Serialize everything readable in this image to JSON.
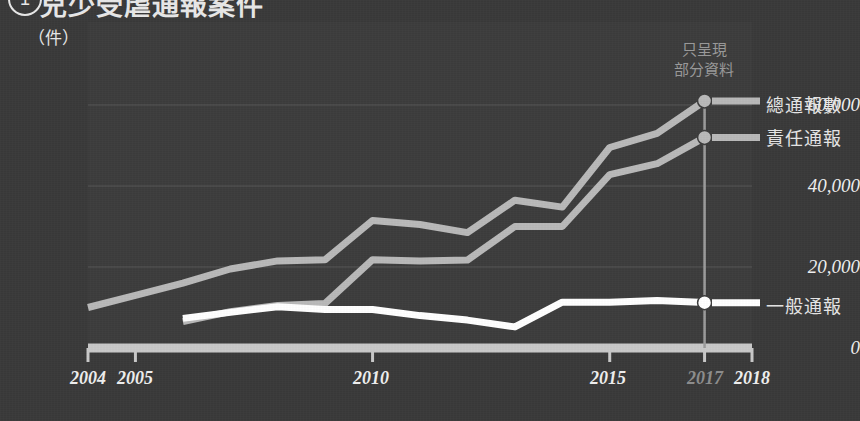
{
  "header": {
    "number": "1",
    "title": "兒少受虐通報案件"
  },
  "annotation": {
    "line1": "只呈現",
    "line2": "部分資料"
  },
  "legend": [
    {
      "label": "總通報數",
      "color": "#b9b9b9",
      "key": "total"
    },
    {
      "label": "責任通報",
      "color": "#b9b9b9",
      "key": "responsible"
    },
    {
      "label": "一般通報",
      "color": "#ffffff",
      "key": "general"
    }
  ],
  "chart_data": {
    "type": "line",
    "title": "兒少受虐通報案件",
    "xlabel": "",
    "ylabel": "件",
    "y_unit_label": "（件）",
    "ylim": [
      0,
      70000
    ],
    "yticks": [
      0,
      20000,
      40000,
      60000
    ],
    "ytick_labels": [
      "0",
      "20,000",
      "40,000",
      "60,000"
    ],
    "grid": true,
    "xlim": [
      2004,
      2018
    ],
    "xticks": [
      2004,
      2005,
      2010,
      2015,
      2017,
      2018
    ],
    "xtick_labels": [
      "2004",
      "2005",
      "2010",
      "2015",
      "2017",
      "2018"
    ],
    "xtick_dimmed": [
      "2017"
    ],
    "legend_position": "right",
    "marker_year": 2017,
    "series": [
      {
        "name": "總通報數",
        "color": "#b9b9b9",
        "x": [
          2004,
          2005,
          2006,
          2007,
          2008,
          2009,
          2010,
          2011,
          2012,
          2013,
          2014,
          2015,
          2016,
          2017
        ],
        "values": [
          10000,
          13000,
          16000,
          19500,
          21500,
          21800,
          31500,
          30500,
          28500,
          36500,
          34800,
          49500,
          53000,
          61000
        ]
      },
      {
        "name": "責任通報",
        "color": "#b9b9b9",
        "x": [
          2006,
          2007,
          2008,
          2009,
          2010,
          2011,
          2012,
          2013,
          2014,
          2015,
          2016,
          2017
        ],
        "values": [
          6500,
          9000,
          10500,
          11000,
          21800,
          21500,
          21700,
          30000,
          30000,
          42800,
          45500,
          52000
        ]
      },
      {
        "name": "一般通報",
        "color": "#ffffff",
        "x": [
          2006,
          2007,
          2008,
          2009,
          2010,
          2011,
          2012,
          2013,
          2014,
          2015,
          2016,
          2017
        ],
        "values": [
          7300,
          8800,
          10200,
          9500,
          9500,
          8000,
          6900,
          5200,
          11300,
          11300,
          11700,
          11200
        ]
      }
    ],
    "endpoint_values": {
      "total": 61000,
      "responsible": 52000,
      "general": 11200
    }
  }
}
